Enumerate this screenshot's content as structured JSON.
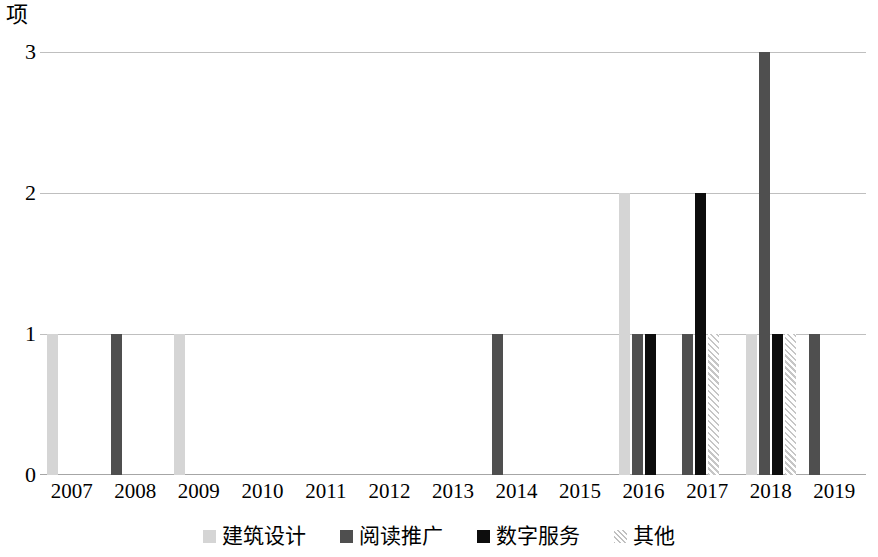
{
  "chart_data": {
    "type": "bar",
    "title": "",
    "subtitle": "",
    "xlabel": "年",
    "ylabel": "项",
    "ylim": [
      0,
      3
    ],
    "yticks": [
      "0",
      "1",
      "2",
      "3"
    ],
    "ytick_values": [
      0,
      1,
      2,
      3
    ],
    "grid": true,
    "legend_position": "bottom",
    "categories": [
      "2007",
      "2008",
      "2009",
      "2010",
      "2011",
      "2012",
      "2013",
      "2014",
      "2015",
      "2016",
      "2017",
      "2018",
      "2019"
    ],
    "series": [
      {
        "name": "建筑设计",
        "color": "#d5d5d5",
        "fill": "solid",
        "values": [
          1,
          0,
          1,
          0,
          0,
          0,
          0,
          0,
          0,
          2,
          0,
          1,
          0
        ]
      },
      {
        "name": "阅读推广",
        "color": "#4f4f4f",
        "fill": "solid",
        "values": [
          0,
          1,
          0,
          0,
          0,
          0,
          0,
          1,
          0,
          1,
          1,
          3,
          1
        ]
      },
      {
        "name": "数字服务",
        "color": "#0d0d0d",
        "fill": "solid",
        "values": [
          0,
          0,
          0,
          0,
          0,
          0,
          0,
          0,
          0,
          1,
          2,
          1,
          0
        ]
      },
      {
        "name": "其他",
        "color": "#c6c6c6",
        "fill": "diagonal-hatch",
        "values": [
          0,
          0,
          0,
          0,
          0,
          0,
          0,
          0,
          0,
          0,
          1,
          1,
          0
        ]
      }
    ]
  },
  "axis": {
    "y_unit": "项",
    "x_unit": "年"
  },
  "legend": {
    "items": [
      {
        "label": "建筑设计",
        "swatch": "legend-swatch-architecture-design"
      },
      {
        "label": "阅读推广",
        "swatch": "legend-swatch-reading-promotion"
      },
      {
        "label": "数字服务",
        "swatch": "legend-swatch-digital-service"
      },
      {
        "label": "其他",
        "swatch": "legend-swatch-other"
      }
    ]
  }
}
